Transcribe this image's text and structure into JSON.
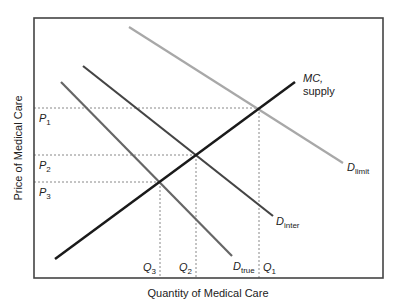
{
  "diagram": {
    "title": "",
    "xlabel": "Quantity of Medical Care",
    "ylabel": "Price of Medical Care",
    "frame": {
      "x1": 34,
      "y1": 18,
      "x2": 383,
      "y2": 278
    },
    "curves": [
      {
        "id": "d_limit",
        "label_main": "D",
        "label_sub": "limit",
        "color": "#a8a8a8",
        "width": 2.2,
        "x1": 129,
        "y1": 27,
        "x2": 343,
        "y2": 163,
        "lx": 347,
        "ly": 171
      },
      {
        "id": "d_inter",
        "label_main": "D",
        "label_sub": "inter",
        "color": "#444444",
        "width": 2.2,
        "x1": 83,
        "y1": 66,
        "x2": 273,
        "y2": 216,
        "lx": 276,
        "ly": 225
      },
      {
        "id": "d_true",
        "label_main": "D",
        "label_sub": "true",
        "color": "#666666",
        "width": 2.2,
        "x1": 61,
        "y1": 82,
        "x2": 232,
        "y2": 256,
        "lx": 233,
        "ly": 270
      },
      {
        "id": "mc_supply",
        "label_main": "MC,",
        "label_sub": "supply",
        "color": "#1a1a1a",
        "width": 2.5,
        "x1": 55,
        "y1": 259,
        "x2": 295,
        "y2": 82,
        "lx": 303,
        "ly": 82
      }
    ],
    "price_levels": [
      {
        "label_main": "P",
        "label_sub": "1",
        "y": 108,
        "x_end": 259
      },
      {
        "label_main": "P",
        "label_sub": "2",
        "y": 155,
        "x_end": 196
      },
      {
        "label_main": "P",
        "label_sub": "3",
        "y": 182,
        "x_end": 160
      }
    ],
    "quantity_levels": [
      {
        "label_main": "Q",
        "label_sub": "3",
        "x": 160,
        "y_start": 182
      },
      {
        "label_main": "Q",
        "label_sub": "2",
        "x": 196,
        "y_start": 155
      },
      {
        "label_main": "Q",
        "label_sub": "1",
        "x": 259,
        "y_start": 108
      }
    ],
    "colors": {
      "frame": "#444444",
      "dash": "#888888",
      "text": "#222222"
    }
  }
}
